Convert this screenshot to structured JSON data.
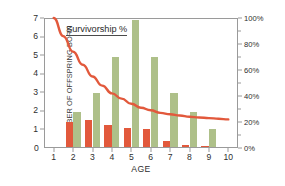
{
  "chart_data": {
    "type": "bar",
    "title": "",
    "xlabel": "AGE",
    "ylabel": "NUMBER OF OFFSPRING BORN",
    "y2label": "",
    "categories": [
      1,
      2,
      3,
      4,
      5,
      6,
      7,
      8,
      9,
      10
    ],
    "xtick_labels": [
      "1",
      "2",
      "3",
      "4",
      "5",
      "6",
      "7",
      "8",
      "9",
      "10"
    ],
    "ylim": [
      0,
      7
    ],
    "ytick_labels": [
      "0",
      "1",
      "2",
      "3",
      "4",
      "5",
      "6",
      "7"
    ],
    "ytick_values": [
      0,
      1,
      2,
      3,
      4,
      5,
      6,
      7
    ],
    "y2lim": [
      0,
      100
    ],
    "y2tick_labels": [
      "0%",
      "20%",
      "40%",
      "60%",
      "80%",
      "100%"
    ],
    "y2tick_values": [
      0,
      20,
      40,
      60,
      80,
      100
    ],
    "y2_minor_values": [
      10,
      30,
      50,
      70,
      90
    ],
    "grid": false,
    "legend": "none",
    "series": [
      {
        "name": "offspring-series-orange",
        "color": "#e2593c",
        "axis": "left",
        "values": [
          0,
          1.35,
          1.45,
          1.2,
          1.0,
          0.95,
          0.3,
          0.12,
          0.04,
          0
        ]
      },
      {
        "name": "offspring-series-green",
        "color": "#aec089",
        "axis": "left",
        "values": [
          0,
          1.9,
          2.9,
          4.85,
          6.85,
          4.85,
          2.9,
          1.9,
          0.95,
          0
        ]
      }
    ],
    "line_series": {
      "name": "Survivorship %",
      "color": "#e2593c",
      "axis": "right",
      "x": [
        1,
        1.5,
        2,
        2.5,
        3,
        3.5,
        4,
        4.5,
        5,
        5.5,
        6,
        6.5,
        7,
        7.5,
        8,
        8.5,
        9,
        9.5,
        10
      ],
      "values": [
        100,
        86,
        74,
        64,
        55,
        48,
        42,
        38,
        34,
        31,
        29,
        27,
        26,
        25,
        24,
        23.5,
        23,
        22.5,
        22
      ]
    },
    "annotation": {
      "text": "Survivorship %"
    }
  }
}
